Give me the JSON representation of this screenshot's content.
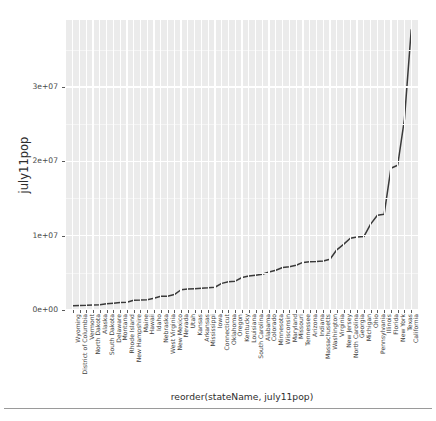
{
  "chart_data": {
    "type": "line",
    "title": "",
    "xlabel": "reorder(stateName, july11pop)",
    "ylabel": "july11pop",
    "ylim": [
      0,
      39000000
    ],
    "y_ticks": [
      0,
      10000000,
      20000000,
      30000000
    ],
    "y_tick_labels": [
      "0e+00",
      "1e+07",
      "2e+07",
      "3e+07"
    ],
    "grid": true,
    "legend": "none",
    "line_color": "#3a3a3a",
    "panel_color": "#ebebeb",
    "grid_color": "#ffffff",
    "categories": [
      "Wyoming",
      "District of Columbia",
      "Vermont",
      "North Dakota",
      "Alaska",
      "South Dakota",
      "Delaware",
      "Montana",
      "Rhode Island",
      "New Hampshire",
      "Maine",
      "Hawaii",
      "Idaho",
      "Nebraska",
      "West Virginia",
      "New Mexico",
      "Nevada",
      "Utah",
      "Kansas",
      "Arkansas",
      "Mississippi",
      "Iowa",
      "Connecticut",
      "Oklahoma",
      "Oregon",
      "Kentucky",
      "Louisiana",
      "South Carolina",
      "Alabama",
      "Colorado",
      "Minnesota",
      "Wisconsin",
      "Maryland",
      "Missouri",
      "Tennessee",
      "Arizona",
      "Indiana",
      "Massachusetts",
      "Washington",
      "Virginia",
      "New Jersey",
      "North Carolina",
      "Georgia",
      "Michigan",
      "Ohio",
      "Pennsylvania",
      "Illinois",
      "Florida",
      "New York",
      "Texas",
      "California"
    ],
    "values": [
      568158,
      617996,
      626431,
      683932,
      722718,
      824082,
      907135,
      998199,
      1051302,
      1318194,
      1328188,
      1374810,
      1584985,
      1842641,
      1855364,
      2082224,
      2723322,
      2817222,
      2871238,
      2937979,
      2978512,
      3062309,
      3580709,
      3791508,
      3871859,
      4369356,
      4574836,
      4679230,
      4802740,
      5116796,
      5344861,
      5711767,
      5828289,
      6010688,
      6403353,
      6482505,
      6516922,
      6587536,
      6830038,
      8096604,
      8821155,
      9656401,
      9815210,
      9876187,
      11544951,
      12742886,
      12869257,
      19057542,
      19465197,
      25674681,
      37691912
    ]
  },
  "axes": {
    "y_title": "july11pop",
    "x_title": "reorder(stateName, july11pop)"
  }
}
